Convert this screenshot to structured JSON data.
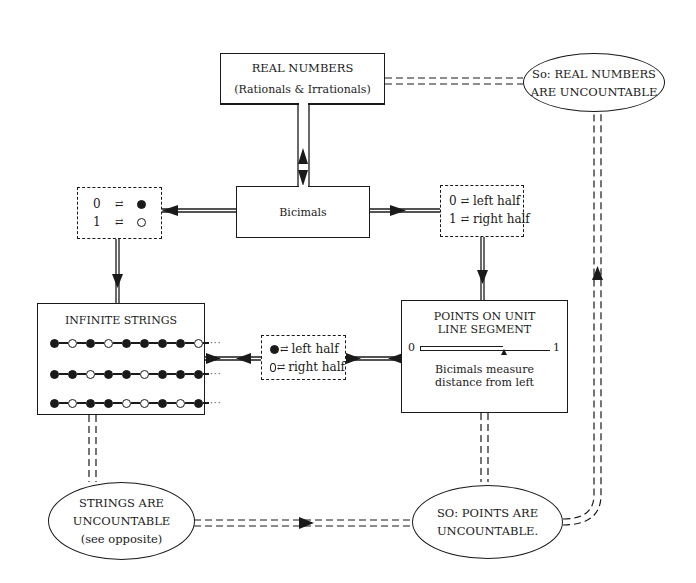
{
  "diagram": {
    "real_numbers": {
      "title": "REAL NUMBERS",
      "subtitle": "(Rationals & Irrationals)"
    },
    "bicimals": {
      "label": "Bicimals"
    },
    "map_dots": {
      "rows": [
        {
          "digit": "0",
          "arrow": "⇄",
          "symbol": "filled"
        },
        {
          "digit": "1",
          "arrow": "⇄",
          "symbol": "hollow"
        }
      ]
    },
    "map_halves": {
      "rows": [
        {
          "digit": "0",
          "arrow": "⇄",
          "text": "left half"
        },
        {
          "digit": "1",
          "arrow": "⇄",
          "text": "right half"
        }
      ]
    },
    "infinite_strings": {
      "title": "INFINITE STRINGS",
      "strings": [
        [
          "f",
          "h",
          "f",
          "h",
          "f",
          "f",
          "f",
          "f",
          "h"
        ],
        [
          "f",
          "f",
          "h",
          "f",
          "f",
          "h",
          "f",
          "f",
          "f"
        ],
        [
          "f",
          "h",
          "f",
          "f",
          "h",
          "h",
          "f",
          "h",
          "f"
        ]
      ],
      "continuation": "···"
    },
    "dot_halves": {
      "rows": [
        {
          "symbol": "filled",
          "arrow": "⇄",
          "text": "left half"
        },
        {
          "symbol": "hollow",
          "arrow": "⇄",
          "text": "right half"
        }
      ]
    },
    "unit_segment": {
      "title_line1": "POINTS ON UNIT",
      "title_line2": "LINE SEGMENT",
      "left_label": "0",
      "right_label": "1",
      "caption_line1": "Bicimals measure",
      "caption_line2": "distance from left"
    },
    "conclusion_real": {
      "line1": "So: REAL NUMBERS",
      "line2": "ARE UNCOUNTABLE"
    },
    "conclusion_strings": {
      "line1": "STRINGS ARE",
      "line2": "UNCOUNTABLE",
      "line3": "(see opposite)"
    },
    "conclusion_points": {
      "line1": "SO: POINTS ARE",
      "line2": "UNCOUNTABLE."
    }
  }
}
